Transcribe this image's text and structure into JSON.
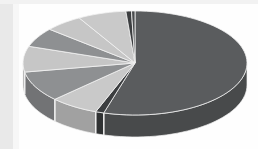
{
  "chart_data": {
    "type": "pie",
    "title": "",
    "subtitle": "",
    "xlabel": "",
    "ylabel": "",
    "legend": "none",
    "grid": false,
    "three_d": true,
    "start_angle_deg": 0,
    "direction": "clockwise",
    "categories": [
      "Segment 1",
      "Segment 2",
      "Segment 3",
      "Segment 4",
      "Segment 5",
      "Segment 6",
      "Segment 7",
      "Segment 8",
      "Segment 9",
      "Segment 10"
    ],
    "values": [
      54.5,
      1.2,
      7.0,
      9.5,
      8.0,
      6.0,
      5.5,
      7.0,
      0.8,
      0.5
    ],
    "colors": [
      "#5a5c5e",
      "#3c3e40",
      "#c9c9c9",
      "#8e9092",
      "#c6c6c6",
      "#8e9092",
      "#c6c6c6",
      "#c9c9c9",
      "#3c3e40",
      "#4a4c4e"
    ],
    "slice_border_color": "#f2f2f2",
    "side_wall_shade": "#4a4c4e",
    "background": "#fefefe",
    "frame_color": "#e9e9e9"
  },
  "figure": {
    "alt_text": "Three dimensional pie chart with one dominant dark gray segment and several smaller light and medium gray segments",
    "center_x": 135,
    "center_y": 63,
    "radius_x": 112,
    "radius_y": 52,
    "depth": 22
  }
}
